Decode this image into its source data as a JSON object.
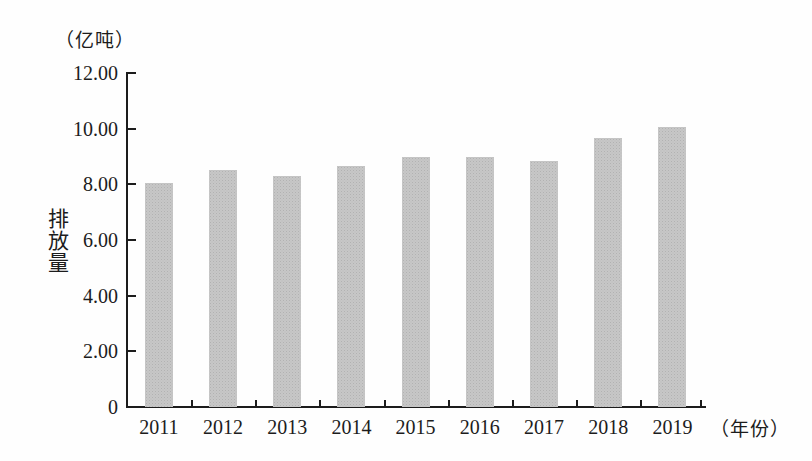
{
  "figure": {
    "unit_label": "（亿吨）",
    "y_axis_title": "排放量",
    "x_axis_suffix": "（年份）"
  },
  "colors": {
    "background": "#fefefe",
    "bar_fill": "#c7c7c7",
    "axis": "#1c1c1c",
    "text": "#1c1c1c"
  },
  "chart_data": {
    "type": "bar",
    "title": "",
    "unit": "（亿吨）",
    "ylabel": "排放量",
    "xlabel": "（年份）",
    "categories": [
      "2011",
      "2012",
      "2013",
      "2014",
      "2015",
      "2016",
      "2017",
      "2018",
      "2019"
    ],
    "values": [
      8.05,
      8.5,
      8.3,
      8.65,
      9.0,
      9.0,
      8.85,
      9.65,
      10.05
    ],
    "ylim": [
      0,
      12
    ],
    "yticks": [
      0,
      2,
      4,
      6,
      8,
      10,
      12
    ],
    "ytick_labels": [
      "0",
      "2.00",
      "4.00",
      "6.00",
      "8.00",
      "10.00",
      "12.00"
    ],
    "grid": false,
    "legend": "none",
    "bar_color": "#c7c7c7"
  }
}
